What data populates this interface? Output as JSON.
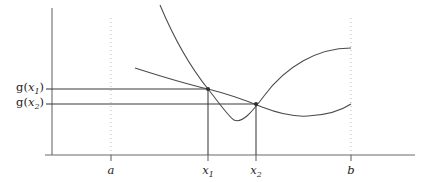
{
  "figure": {
    "title": "",
    "background_color": "#ffffff",
    "axis_color": "#6b6b6b",
    "curve_color": "#4a4a4a",
    "guide_color": "#b9b9b9",
    "level_line_color": "#3a3a3a"
  },
  "labels": {
    "x_axis": [
      {
        "name": "a",
        "symbol": "a",
        "subscript": ""
      },
      {
        "name": "x1",
        "symbol": "x",
        "subscript": "1"
      },
      {
        "name": "x2",
        "symbol": "x",
        "subscript": "2"
      },
      {
        "name": "b",
        "symbol": "b",
        "subscript": ""
      }
    ],
    "y_axis": [
      {
        "name": "gx1",
        "prefix": "g(",
        "symbol": "x",
        "subscript": "1",
        "suffix": ")"
      },
      {
        "name": "gx2",
        "prefix": "g(",
        "symbol": "x",
        "subscript": "2",
        "suffix": ")"
      }
    ],
    "a_text": "a",
    "b_text": "b",
    "x1_text": "x",
    "x1_sub": "1",
    "x2_text": "x",
    "x2_sub": "2",
    "gx1_open": "g(",
    "gx1_var": "x",
    "gx1_sub": "1",
    "gx1_close": ")",
    "gx2_open": "g(",
    "gx2_var": "x",
    "gx2_sub": "2",
    "gx2_close": ")"
  },
  "chart_data": {
    "type": "line",
    "title": "",
    "xlabel": "",
    "ylabel": "",
    "grid": false,
    "legend_position": "none",
    "axis": {
      "y_axis_x_px": 52,
      "y_axis_top_px": 8,
      "x_axis_y_px": 155,
      "x_axis_right_px": 415
    },
    "x_ticks": [
      {
        "label": "a",
        "x_px": 111,
        "style": "dotted-vertical"
      },
      {
        "label": "x1",
        "x_px": 208,
        "style": "solid-vertical"
      },
      {
        "label": "x2",
        "x_px": 256,
        "style": "solid-vertical"
      },
      {
        "label": "b",
        "x_px": 351,
        "style": "dotted-vertical"
      }
    ],
    "y_ticks": [
      {
        "label": "g(x1)",
        "y_px": 89
      },
      {
        "label": "g(x2)",
        "y_px": 104
      }
    ],
    "series": [
      {
        "name": "steep-curve",
        "description": "narrow convex curve with minimum between x1 and x2",
        "path": "M 160 5 C 178 48, 196 74, 208 89 C 220 104, 228 116, 234 120 C 242 124, 252 112, 264 96 C 286 66, 318 48, 351 48",
        "points_px": [
          [
            160,
            5
          ],
          [
            208,
            89
          ],
          [
            234,
            120
          ],
          [
            256,
            104
          ],
          [
            351,
            48
          ]
        ]
      },
      {
        "name": "flat-curve",
        "description": "wide convex curve with minimum to the right of x2",
        "path": "M 135 68 C 160 76, 186 84, 208 89 C 232 95, 250 102, 262 107 C 280 114, 294 117, 308 116 C 328 115, 342 110, 351 104",
        "points_px": [
          [
            135,
            68
          ],
          [
            208,
            89
          ],
          [
            256,
            104
          ],
          [
            308,
            116
          ],
          [
            351,
            104
          ]
        ]
      }
    ],
    "markers": [
      {
        "name": "intersection-x1",
        "x_px": 208,
        "y_px": 89,
        "label": "g(x1)"
      },
      {
        "name": "intersection-x2",
        "x_px": 256,
        "y_px": 104,
        "label": "g(x2)"
      }
    ],
    "level_lines": [
      {
        "name": "gx1-level",
        "from_px": [
          52,
          89
        ],
        "to_px": [
          208,
          89
        ]
      },
      {
        "name": "gx2-level",
        "from_px": [
          52,
          104
        ],
        "to_px": [
          256,
          104
        ]
      }
    ],
    "drop_lines": [
      {
        "name": "x1-drop",
        "from_px": [
          208,
          89
        ],
        "to_px": [
          208,
          155
        ]
      },
      {
        "name": "x2-drop",
        "from_px": [
          256,
          104
        ],
        "to_px": [
          256,
          155
        ]
      }
    ]
  }
}
